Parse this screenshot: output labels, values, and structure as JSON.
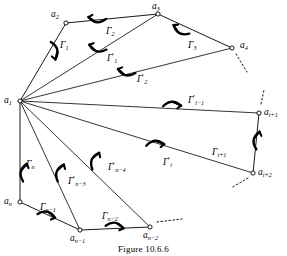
{
  "figure": {
    "caption": "Figure 10.6.6",
    "kind": "fan-triangulation-of-polygon",
    "stroke_color": "#000000",
    "background_color": "#ffffff"
  },
  "vertices": [
    {
      "id": "a1",
      "label": "a",
      "sub": "1",
      "x": 20,
      "y": 101,
      "label_x": 4,
      "label_y": 96
    },
    {
      "id": "a2",
      "label": "a",
      "sub": "2",
      "x": 66,
      "y": 23,
      "label_x": 51,
      "label_y": 10
    },
    {
      "id": "a3",
      "label": "a",
      "sub": "3",
      "x": 158,
      "y": 14,
      "label_x": 152,
      "label_y": 2
    },
    {
      "id": "a4",
      "label": "a",
      "sub": "4",
      "x": 232,
      "y": 48,
      "label_x": 240,
      "label_y": 41
    },
    {
      "id": "ai1",
      "label": "a",
      "sub": "i+1",
      "x": 259,
      "y": 113,
      "label_x": 264,
      "label_y": 108
    },
    {
      "id": "ai2",
      "label": "a",
      "sub": "i+2",
      "x": 253,
      "y": 173,
      "label_x": 258,
      "label_y": 168
    },
    {
      "id": "an2",
      "label": "a",
      "sub": "n−2",
      "x": 150,
      "y": 227,
      "label_x": 143,
      "label_y": 231
    },
    {
      "id": "an1",
      "label": "a",
      "sub": "n−1",
      "x": 80,
      "y": 230,
      "label_x": 70,
      "label_y": 234
    },
    {
      "id": "an",
      "label": "a",
      "sub": "n",
      "x": 20,
      "y": 202,
      "label_x": 4,
      "label_y": 197
    }
  ],
  "polygon_edges": [
    {
      "from": "a1",
      "to": "a2"
    },
    {
      "from": "a2",
      "to": "a3"
    },
    {
      "from": "a3",
      "to": "a4"
    },
    {
      "from": "ai1",
      "to": "ai2"
    },
    {
      "from": "an2",
      "to": "an1"
    },
    {
      "from": "an1",
      "to": "an"
    },
    {
      "from": "an",
      "to": "a1"
    }
  ],
  "diagonals": [
    {
      "from": "a1",
      "to": "a3"
    },
    {
      "from": "a1",
      "to": "a4"
    },
    {
      "from": "a1",
      "to": "ai1"
    },
    {
      "from": "a1",
      "to": "ai2"
    },
    {
      "from": "a1",
      "to": "an2"
    },
    {
      "from": "a1",
      "to": "an1"
    }
  ],
  "dashed_stubs": [
    {
      "id": "stub-a4",
      "x1": 236,
      "y1": 54,
      "x2": 247,
      "y2": 72
    },
    {
      "id": "stub-ai1",
      "x1": 261,
      "y1": 104,
      "x2": 264,
      "y2": 90
    },
    {
      "id": "stub-ai2",
      "x1": 248,
      "y1": 178,
      "x2": 231,
      "y2": 188
    },
    {
      "id": "dots-an2",
      "x1": 157,
      "y1": 222,
      "x2": 182,
      "y2": 219
    }
  ],
  "curve_labels": [
    {
      "id": "G1",
      "base": "Γ",
      "prime": false,
      "sub": "1",
      "label_x": 60,
      "label_y": 41
    },
    {
      "id": "G2",
      "base": "Γ",
      "prime": false,
      "sub": "2",
      "label_x": 106,
      "label_y": 27
    },
    {
      "id": "G3",
      "base": "Γ",
      "prime": false,
      "sub": "3",
      "label_x": 188,
      "label_y": 41
    },
    {
      "id": "G1p",
      "base": "Γ",
      "prime": true,
      "sub": "1",
      "label_x": 107,
      "label_y": 54
    },
    {
      "id": "G2p",
      "base": "Γ",
      "prime": true,
      "sub": "2",
      "label_x": 137,
      "label_y": 75
    },
    {
      "id": "Gi1p",
      "base": "Γ",
      "prime": true,
      "sub": "i−1",
      "label_x": 188,
      "label_y": 96
    },
    {
      "id": "Gip",
      "base": "Γ",
      "prime": true,
      "sub": "i",
      "label_x": 163,
      "label_y": 158
    },
    {
      "id": "Gi1",
      "base": "Γ",
      "prime": false,
      "sub": "i+1",
      "label_x": 212,
      "label_y": 148
    },
    {
      "id": "Gn",
      "base": "Γ",
      "prime": false,
      "sub": "n",
      "label_x": 26,
      "label_y": 160
    },
    {
      "id": "Gn3p",
      "base": "Γ",
      "prime": true,
      "sub": "n−3",
      "label_x": 68,
      "label_y": 177
    },
    {
      "id": "Gn4p",
      "base": "Γ",
      "prime": true,
      "sub": "n−4",
      "label_x": 108,
      "label_y": 163
    },
    {
      "id": "Gn1",
      "base": "Γ",
      "prime": false,
      "sub": "n−1",
      "label_x": 40,
      "label_y": 203
    },
    {
      "id": "Gn2",
      "base": "Γ",
      "prime": false,
      "sub": "n−2",
      "label_x": 102,
      "label_y": 212
    }
  ],
  "arrow_marks": [
    {
      "id": "arrow-G1",
      "cx": 56,
      "cy": 50,
      "rot": 75,
      "flip": false
    },
    {
      "id": "arrow-G2",
      "cx": 97,
      "cy": 21,
      "rot": 186,
      "flip": false
    },
    {
      "id": "arrow-G3",
      "cx": 180,
      "cy": 32,
      "rot": 208,
      "flip": false
    },
    {
      "id": "arrow-G1p",
      "cx": 97,
      "cy": 50,
      "rot": 196,
      "flip": false
    },
    {
      "id": "arrow-G2p",
      "cx": 126,
      "cy": 74,
      "rot": 193,
      "flip": false
    },
    {
      "id": "arrow-Gi1p",
      "cx": 172,
      "cy": 103,
      "rot": 358,
      "flip": false
    },
    {
      "id": "arrow-Gip",
      "cx": 155,
      "cy": 142,
      "rot": 355,
      "flip": false
    },
    {
      "id": "arrow-Gi1",
      "cx": 255,
      "cy": 140,
      "rot": 280,
      "flip": false
    },
    {
      "id": "arrow-Gn",
      "cx": 22,
      "cy": 172,
      "rot": 282,
      "flip": false
    },
    {
      "id": "arrow-Gn3p",
      "cx": 58,
      "cy": 172,
      "rot": 290,
      "flip": false
    },
    {
      "id": "arrow-Gn4p",
      "cx": 93,
      "cy": 160,
      "rot": 292,
      "flip": false
    },
    {
      "id": "arrow-Gn1",
      "cx": 47,
      "cy": 213,
      "rot": 12,
      "flip": false
    },
    {
      "id": "arrow-Gn2",
      "cx": 115,
      "cy": 224,
      "rot": 8,
      "flip": false
    }
  ]
}
